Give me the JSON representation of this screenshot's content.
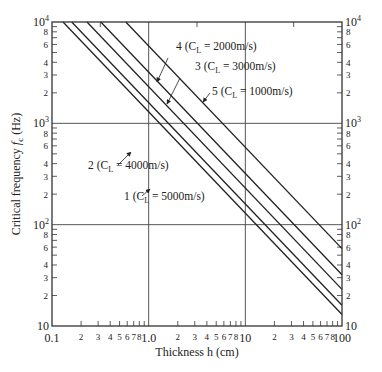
{
  "chart_data": {
    "type": "line",
    "title": "",
    "xlabel": "Thickness h (cm)",
    "ylabel": "Critical frequency f_c (Hz)",
    "xscale": "log",
    "yscale": "log",
    "xlim": [
      0.1,
      100
    ],
    "ylim": [
      10,
      10000
    ],
    "grid": "major decades only",
    "x_tick_labels_major": [
      "0.1",
      "1.0",
      "10",
      "100"
    ],
    "x_tick_labels_minor": [
      "2",
      "3",
      "4",
      "5",
      "6",
      "7",
      "8"
    ],
    "y_tick_labels_major": [
      "10",
      "10^2",
      "10^3",
      "10^4"
    ],
    "y_tick_labels_minor": [
      "2",
      "3",
      "4",
      "6",
      "8"
    ],
    "legend_position": "inline annotations with arrows",
    "series": [
      {
        "name": "1 (C_L = 5000m/s)",
        "id": 1,
        "C_L": 5000,
        "fc_times_h_Hz_cm": 1300,
        "x": [
          0.13,
          100
        ],
        "values": [
          10000,
          13
        ]
      },
      {
        "name": "2 (C_L = 4000m/s)",
        "id": 2,
        "C_L": 4000,
        "fc_times_h_Hz_cm": 1600,
        "x": [
          0.16,
          100
        ],
        "values": [
          10000,
          16
        ]
      },
      {
        "name": "3 (C_L = 3000m/s)",
        "id": 3,
        "C_L": 3000,
        "fc_times_h_Hz_cm": 2300,
        "x": [
          0.23,
          100
        ],
        "values": [
          10000,
          23
        ]
      },
      {
        "name": "4 (C_L = 2000m/s)",
        "id": 4,
        "C_L": 2000,
        "fc_times_h_Hz_cm": 3200,
        "x": [
          0.32,
          100
        ],
        "values": [
          10000,
          32
        ]
      },
      {
        "name": "5 (C_L = 1000m/s)",
        "id": 5,
        "C_L": 1000,
        "fc_times_h_Hz_cm": 5800,
        "x": [
          0.58,
          100
        ],
        "values": [
          10000,
          58
        ]
      }
    ]
  },
  "labels": {
    "xlabel": "Thickness h (cm)",
    "ylabel_prefix": "Critical frequency ",
    "ylabel_var": "f",
    "ylabel_sub": "c",
    "ylabel_unit": " (Hz)",
    "series": [
      {
        "num": "1",
        "text_a": " (C",
        "sub": "L",
        "text_b": " = 5000m/s)"
      },
      {
        "num": "2",
        "text_a": " (C",
        "sub": "L",
        "text_b": " = 4000m/s)"
      },
      {
        "num": "3",
        "text_a": " (C",
        "sub": "L",
        "text_b": " = 3000m/s)"
      },
      {
        "num": "4",
        "text_a": " (C",
        "sub": "L",
        "text_b": " = 2000m/s)"
      },
      {
        "num": "5",
        "text_a": " (C",
        "sub": "L",
        "text_b": " = 1000m/s)"
      }
    ]
  }
}
